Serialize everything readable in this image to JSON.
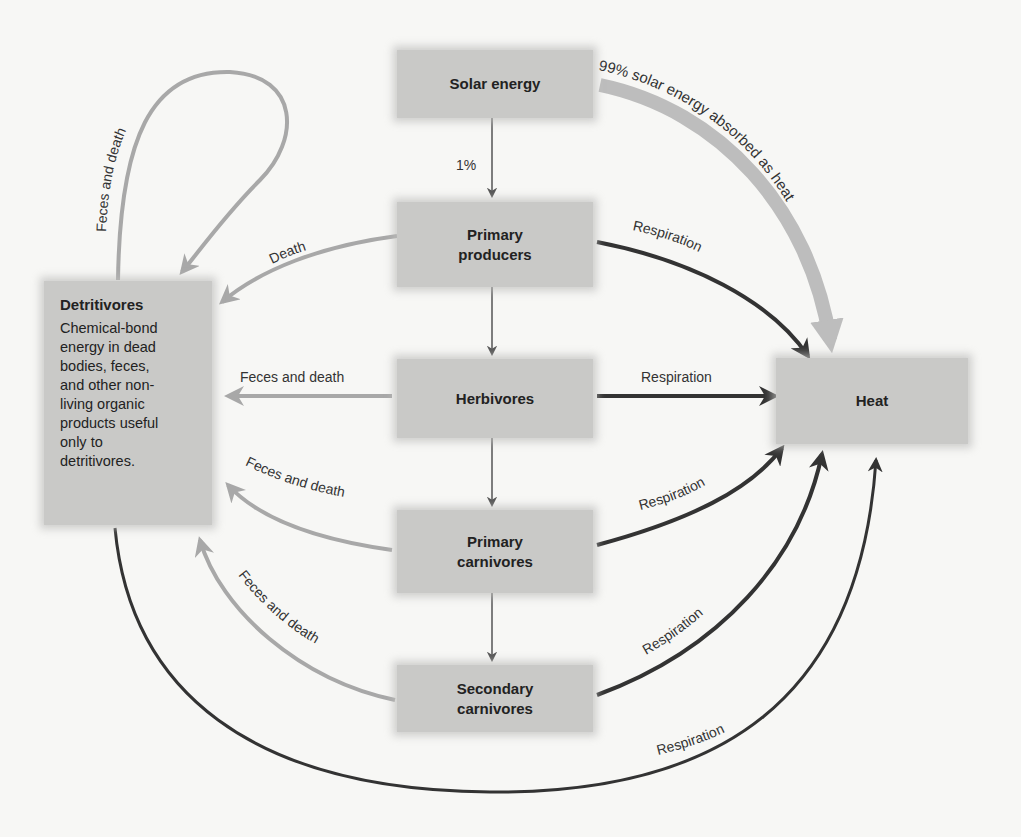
{
  "nodes": {
    "solar": "Solar energy",
    "producers": "Primary\nproducers",
    "herbivores": "Herbivores",
    "primary_carnivores": "Primary\ncarnivores",
    "secondary_carnivores": "Secondary\ncarnivores",
    "heat": "Heat",
    "detritivores": {
      "title": "Detritivores",
      "description": "Chemical-bond\nenergy in dead\nbodies, feces,\nand other non-\nliving organic\nproducts useful\nonly to\ndetritivores."
    }
  },
  "edges": {
    "solar_to_producers": "1%",
    "solar_to_heat": "99% solar energy absorbed as heat",
    "producers_to_detritivores": "Death",
    "producers_to_heat": "Respiration",
    "herbivores_to_detritivores": "Feces and death",
    "herbivores_to_heat": "Respiration",
    "primary_carnivores_to_detritivores": "Feces and death",
    "primary_carnivores_to_heat": "Respiration",
    "secondary_carnivores_to_detritivores": "Feces and death",
    "secondary_carnivores_to_heat": "Respiration",
    "detritivores_self": "Feces and death",
    "detritivores_to_heat": "Respiration"
  },
  "colors": {
    "node_fill": "#c9c9c7",
    "energy_flow_arrow": "#555555",
    "respiration_arrow": "#333333",
    "detritus_arrow": "#a8a8a8",
    "solar_heat_arrow": "#bdbdbd"
  }
}
